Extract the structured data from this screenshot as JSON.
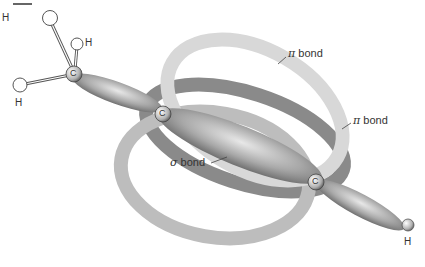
{
  "diagram": {
    "labels": {
      "pi_bond_1": "bond",
      "pi_bond_2": "bond",
      "sigma_bond": "bond",
      "pi_symbol": "π",
      "sigma_symbol": "σ"
    },
    "atoms": {
      "h1": "H",
      "h2": "H",
      "h3": "H",
      "c1": "C",
      "c2": "C",
      "c3": "C",
      "h4": "H"
    }
  }
}
